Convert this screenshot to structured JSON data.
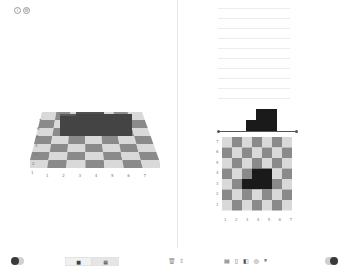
{
  "window": {
    "top_icons": [
      {
        "name": "info-icon",
        "glyph": "i"
      },
      {
        "name": "settings-icon",
        "glyph": "⚙"
      }
    ]
  },
  "left_panel": {
    "view": "3d-checkerboard",
    "x_ticks": [
      "1",
      "2",
      "3",
      "4",
      "5",
      "6",
      "7"
    ],
    "y_ticks": [
      "7",
      "6",
      "5",
      "4",
      "3",
      "2",
      "1"
    ]
  },
  "right_panel": {
    "view": "2d-checkerboard",
    "x_ticks": [
      "1",
      "2",
      "3",
      "4",
      "5",
      "6",
      "7"
    ],
    "y_ticks": [
      "7",
      "6",
      "5",
      "4",
      "3",
      "2",
      "1"
    ],
    "line_count": 10
  },
  "toolbar": {
    "left_toggle": "on",
    "segment": [
      {
        "label": "■",
        "name": "view-2d-button"
      },
      {
        "label": "▦",
        "name": "view-3d-button"
      }
    ],
    "mini_icons": [
      {
        "glyph": "🗑",
        "name": "trash-icon"
      },
      {
        "glyph": "⇪",
        "name": "share-icon"
      }
    ],
    "tools": [
      {
        "glyph": "▤",
        "name": "grid-tool-icon"
      },
      {
        "glyph": "▯",
        "name": "block-tool-icon"
      },
      {
        "glyph": "◧",
        "name": "layer-tool-icon"
      },
      {
        "glyph": "◎",
        "name": "camera-tool-icon"
      },
      {
        "glyph": "⏸",
        "name": "pause-icon"
      }
    ],
    "right_toggle": "on"
  },
  "colors": {
    "light_cell": "#d9d9d9",
    "dark_cell": "#8a8a8a",
    "block": "#1a1a1a",
    "block_3d": "#3e3e3e"
  }
}
